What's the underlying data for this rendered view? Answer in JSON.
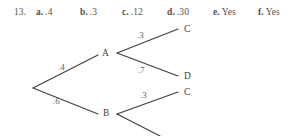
{
  "answer_line": {
    "problem_number": "13.",
    "answers": [
      {
        "key": "a.",
        "value": ".4"
      },
      {
        "key": "b.",
        "value": ".3"
      },
      {
        "key": "c.",
        "value": ".12"
      },
      {
        "key": "d.",
        "value": ".30"
      },
      {
        "key": "e.",
        "value": "Yes"
      },
      {
        "key": "f.",
        "value": "Yes"
      }
    ]
  },
  "tree_diagram": {
    "nodes": [
      {
        "id": "root",
        "label": ""
      },
      {
        "id": "A",
        "label": "A"
      },
      {
        "id": "B",
        "label": "B"
      },
      {
        "id": "C1",
        "label": "C"
      },
      {
        "id": "D1",
        "label": "D"
      },
      {
        "id": "C2",
        "label": "C"
      }
    ],
    "edge_labels": [
      {
        "id": "root-A",
        "label": ".4"
      },
      {
        "id": "root-B",
        "label": ".6"
      },
      {
        "id": "A-C",
        "label": ".3"
      },
      {
        "id": "A-D",
        "label": ".7"
      },
      {
        "id": "B-C",
        "label": ".3"
      }
    ],
    "stroke_color": "#3f3d3c",
    "text_color": "#4a4a4a"
  }
}
